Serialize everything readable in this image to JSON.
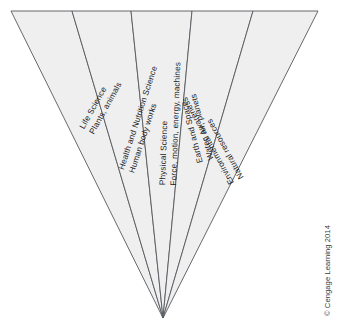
{
  "figure": {
    "type": "fan-diagram",
    "shape": "inverted-triangle",
    "apex": {
      "x": 163,
      "y": 318
    },
    "top_edge": {
      "left_x": 11,
      "right_x": 318,
      "y": 11
    },
    "fill_color": "#efefef",
    "stroke_color": "#55585c",
    "background_color": "#ffffff",
    "wedges": [
      {
        "id": "life-science",
        "title": "Life Science",
        "detail": "Plants, animals",
        "top_left_x": 11,
        "top_right_x": 72,
        "label_x": 78,
        "label_y": 126,
        "label_angle": -61
      },
      {
        "id": "health-and-nutrition-science",
        "title": "Health and Nutrition Science",
        "detail": "Human body works",
        "top_left_x": 72,
        "top_right_x": 131,
        "label_x": 117,
        "label_y": 168,
        "label_angle": -72
      },
      {
        "id": "physical-science",
        "title": "Physical Science",
        "detail": "Force, motion, energy, machines",
        "top_left_x": 131,
        "top_right_x": 192,
        "label_x": 158,
        "label_y": 185,
        "label_angle": -88
      },
      {
        "id": "earth-and-space",
        "title": "Earth and Space",
        "detail": "Water, air, planets",
        "top_left_x": 192,
        "top_right_x": 253,
        "label_x": 196,
        "label_y": 164,
        "label_angle": -105
      },
      {
        "id": "environmental-awareness",
        "title": "Environmental Awareness",
        "detail": "Natural resources",
        "top_left_x": 253,
        "top_right_x": 318,
        "label_x": 228,
        "label_y": 186,
        "label_angle": -119
      }
    ]
  },
  "credit": {
    "text": "© Cengage Learning 2014"
  }
}
